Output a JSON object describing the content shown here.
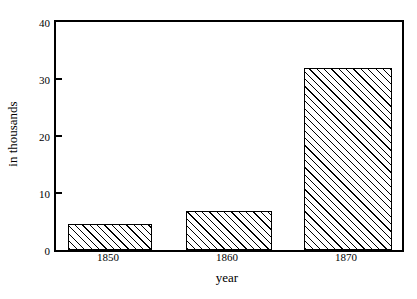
{
  "chart_data": {
    "type": "bar",
    "title": "",
    "subtitle": "",
    "xlabel": "year",
    "ylabel": "in thousands",
    "categories": [
      "1850",
      "1860",
      "1870"
    ],
    "values": [
      4.5,
      6.8,
      32
    ],
    "series": [
      {
        "name": "in thousands",
        "values": [
          4.5,
          6.8,
          32
        ]
      }
    ],
    "ylim": [
      0,
      40
    ],
    "yticks": [
      0,
      10,
      20,
      30,
      40
    ],
    "ytick_labels": [
      "0",
      "10",
      "20",
      "30",
      "40"
    ],
    "xtick_labels": [
      "1850",
      "1860",
      "1870"
    ],
    "grid": false,
    "legend": null,
    "legend_position": "none",
    "bar_fill": "diagonal-hatch",
    "colors": {
      "axis": "#000000",
      "bar_outline": "#000000",
      "bar_hatch": "#000000",
      "background": "#ffffff"
    }
  },
  "axes": {
    "y": {
      "ticks": [
        {
          "label": "40",
          "value": 40
        },
        {
          "label": "30",
          "value": 30
        },
        {
          "label": "20",
          "value": 20
        },
        {
          "label": "10",
          "value": 10
        },
        {
          "label": "0",
          "value": 0
        }
      ],
      "title": "in thousands"
    },
    "x": {
      "ticks": [
        {
          "label": "1850"
        },
        {
          "label": "1860"
        },
        {
          "label": "1870"
        }
      ],
      "title": "year"
    }
  },
  "bars": [
    {
      "category": "1850",
      "value": 4.5
    },
    {
      "category": "1860",
      "value": 6.8
    },
    {
      "category": "1870",
      "value": 32
    }
  ]
}
